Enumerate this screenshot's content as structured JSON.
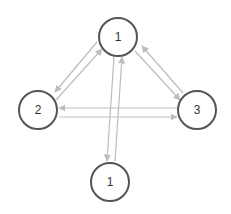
{
  "diagram": {
    "type": "directed-graph",
    "colors": {
      "background": "#ffffff",
      "node_stroke": "#555555",
      "node_fill": "#ffffff",
      "edge": "#bdbdbd",
      "label": "#333333"
    },
    "nodes": [
      {
        "id": "n_top",
        "label": "1",
        "cx": 118,
        "cy": 37,
        "r": 19
      },
      {
        "id": "n_left",
        "label": "2",
        "cx": 38,
        "cy": 110,
        "r": 19
      },
      {
        "id": "n_right",
        "label": "3",
        "cx": 197,
        "cy": 110,
        "r": 19
      },
      {
        "id": "n_bottom",
        "label": "1",
        "cx": 110,
        "cy": 182,
        "r": 19
      }
    ],
    "edges": [
      {
        "from": "n_top",
        "to": "n_left",
        "x1": 97,
        "y1": 42,
        "x2": 55,
        "y2": 92
      },
      {
        "from": "n_left",
        "to": "n_top",
        "x1": 56,
        "y1": 100,
        "x2": 102,
        "y2": 49
      },
      {
        "from": "n_top",
        "to": "n_right",
        "x1": 135,
        "y1": 51,
        "x2": 180,
        "y2": 100
      },
      {
        "from": "n_right",
        "to": "n_top",
        "x1": 183,
        "y1": 93,
        "x2": 142,
        "y2": 46
      },
      {
        "from": "n_right",
        "to": "n_left",
        "x1": 177,
        "y1": 108,
        "x2": 59,
        "y2": 108
      },
      {
        "from": "n_left",
        "to": "n_right",
        "x1": 59,
        "y1": 117,
        "x2": 177,
        "y2": 117
      },
      {
        "from": "n_top",
        "to": "n_bottom",
        "x1": 114,
        "y1": 57,
        "x2": 107,
        "y2": 161
      },
      {
        "from": "n_bottom",
        "to": "n_top",
        "x1": 115,
        "y1": 161,
        "x2": 122,
        "y2": 57
      }
    ]
  }
}
